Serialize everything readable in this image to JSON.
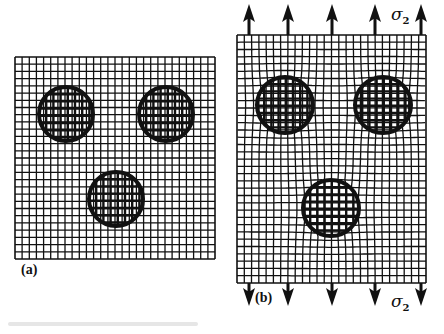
{
  "figure": {
    "panels": [
      {
        "id": "a",
        "label": "(a)",
        "description": "Undeformed square grid with three circular inclusions",
        "grid": {
          "x": 15,
          "y": 57,
          "width": 200,
          "height": 202,
          "cell": 7.2
        },
        "inclusions": [
          {
            "cx": 66,
            "cy": 114,
            "r": 27
          },
          {
            "cx": 166,
            "cy": 114,
            "r": 27
          },
          {
            "cx": 116,
            "cy": 199,
            "r": 27
          }
        ]
      },
      {
        "id": "b",
        "label": "(b)",
        "description": "Grid deformed under uniaxial tensile stress sigma_2",
        "grid": {
          "x": 237,
          "y": 35,
          "width": 189,
          "height": 248,
          "cell": 7.2
        },
        "inclusions": [
          {
            "cx": 285,
            "cy": 105,
            "r": 28
          },
          {
            "cx": 383,
            "cy": 105,
            "r": 28
          },
          {
            "cx": 331,
            "cy": 208,
            "r": 28
          }
        ]
      }
    ],
    "stress_label": "σ",
    "stress_subscript": "2",
    "arrows_top_x": [
      249,
      288,
      332,
      375,
      421
    ],
    "arrows_bottom_x": [
      249,
      288,
      332,
      375,
      421
    ],
    "caption": "",
    "colors": {
      "line": "#111111",
      "background": "#ffffff"
    }
  }
}
